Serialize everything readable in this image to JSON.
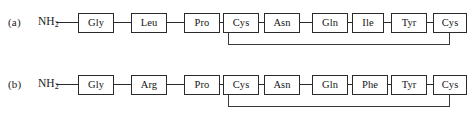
{
  "figure": {
    "background_color": "#ffffff",
    "line_color": "#2b2b2b",
    "text_color": "#141414"
  },
  "panels": [
    {
      "id": "a",
      "label": "(a)",
      "n_terminus": "NH",
      "n_terminus_subscript": "2",
      "residues": [
        {
          "label": "Gly",
          "x": 78,
          "width": 36
        },
        {
          "label": "Leu",
          "x": 131,
          "width": 36
        },
        {
          "label": "Pro",
          "x": 184,
          "width": 36
        },
        {
          "label": "Cys",
          "x": 223,
          "width": 36
        },
        {
          "label": "Asn",
          "x": 264,
          "width": 36
        },
        {
          "label": "Gln",
          "x": 312,
          "width": 36
        },
        {
          "label": "Ile",
          "x": 352,
          "width": 32
        },
        {
          "label": "Tyr",
          "x": 391,
          "width": 36
        },
        {
          "label": "Cys",
          "x": 433,
          "width": 34
        }
      ],
      "terminus_connector": {
        "x": 56,
        "width": 22
      },
      "connectors": [
        {
          "x": 114,
          "width": 17
        },
        {
          "x": 167,
          "width": 17
        },
        {
          "x": 220,
          "width": 3
        },
        {
          "x": 259,
          "width": 5
        },
        {
          "x": 300,
          "width": 12
        },
        {
          "x": 348,
          "width": 4
        },
        {
          "x": 384,
          "width": 7
        },
        {
          "x": 427,
          "width": 6
        }
      ],
      "disulfide_bridge": {
        "from_residue": "Cys",
        "from_index": 3,
        "to_residue": "Cys",
        "to_index": 8,
        "left_x": 228,
        "right_x": 449,
        "top_y": 33,
        "bottom_y": 44
      }
    },
    {
      "id": "b",
      "label": "(b)",
      "n_terminus": "NH",
      "n_terminus_subscript": "2",
      "residues": [
        {
          "label": "Gly",
          "x": 78,
          "width": 36
        },
        {
          "label": "Arg",
          "x": 131,
          "width": 36
        },
        {
          "label": "Pro",
          "x": 184,
          "width": 36
        },
        {
          "label": "Cys",
          "x": 223,
          "width": 36
        },
        {
          "label": "Asn",
          "x": 264,
          "width": 36
        },
        {
          "label": "Gln",
          "x": 312,
          "width": 36
        },
        {
          "label": "Phe",
          "x": 352,
          "width": 36
        },
        {
          "label": "Tyr",
          "x": 391,
          "width": 36
        },
        {
          "label": "Cys",
          "x": 433,
          "width": 34
        }
      ],
      "terminus_connector": {
        "x": 56,
        "width": 22
      },
      "connectors": [
        {
          "x": 114,
          "width": 17
        },
        {
          "x": 167,
          "width": 17
        },
        {
          "x": 220,
          "width": 3
        },
        {
          "x": 259,
          "width": 5
        },
        {
          "x": 300,
          "width": 12
        },
        {
          "x": 348,
          "width": 4
        },
        {
          "x": 388,
          "width": 3
        },
        {
          "x": 427,
          "width": 6
        }
      ],
      "disulfide_bridge": {
        "from_residue": "Cys",
        "from_index": 3,
        "to_residue": "Cys",
        "to_index": 8,
        "left_x": 228,
        "right_x": 449,
        "top_y": 33,
        "bottom_y": 44
      }
    }
  ]
}
